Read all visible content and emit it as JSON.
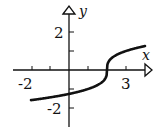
{
  "chart_data": {
    "type": "line",
    "title": "",
    "xlabel": "x",
    "ylabel": "y",
    "function": "y = cbrt(x - 2)",
    "xlim": [
      -2.0,
      4.2
    ],
    "ylim": [
      -3.3,
      3.3
    ],
    "x_ticks": [
      -2,
      -1,
      1,
      2,
      3
    ],
    "x_tick_labels": [
      "-2",
      "3"
    ],
    "y_ticks": [
      2,
      1,
      -1,
      -2
    ],
    "y_tick_labels": [
      "2",
      "-2"
    ],
    "grid": false,
    "legend": null,
    "series": [
      {
        "name": "curve",
        "x": [
          -2,
          -1,
          0,
          1,
          1.5,
          1.9,
          2,
          2.1,
          2.5,
          3,
          4
        ],
        "y": [
          -1.59,
          -1.44,
          -1.26,
          -1.0,
          -0.79,
          -0.46,
          0,
          0.46,
          0.79,
          1.0,
          1.26
        ]
      }
    ]
  },
  "labels": {
    "x_axis": "x",
    "y_axis": "y",
    "tick_neg2_x": "-2",
    "tick_3_x": "3",
    "tick_2_y": "2",
    "tick_neg2_y": "-2"
  },
  "colors": {
    "axis": "#111111",
    "curve": "#111111",
    "background": "#ffffff"
  }
}
